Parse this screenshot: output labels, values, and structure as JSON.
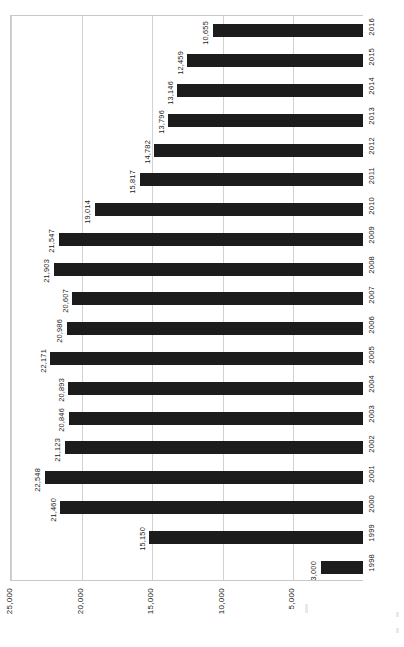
{
  "chart_data": {
    "type": "bar",
    "orientation": "horizontal",
    "page_rotation_deg": 90,
    "title": "",
    "subtitle": "",
    "xlabel": "",
    "ylabel": "",
    "categories": [
      "1998",
      "1999",
      "2000",
      "2001",
      "2002",
      "2003",
      "2004",
      "2005",
      "2006",
      "2007",
      "2008",
      "2009",
      "2010",
      "2011",
      "2012",
      "2013",
      "2014",
      "2015",
      "2016"
    ],
    "values": [
      3000,
      15150,
      21460,
      22548,
      21123,
      20846,
      20893,
      22171,
      20986,
      20607,
      21903,
      21547,
      19014,
      15817,
      14782,
      13796,
      13146,
      12459,
      10655
    ],
    "value_labels": [
      "3,000",
      "15,150",
      "21,460",
      "22,548",
      "21,123",
      "20,846",
      "20,893",
      "22,171",
      "20,986",
      "20,607",
      "21,903",
      "21,547",
      "19,014",
      "15,817",
      "14,782",
      "13,796",
      "13,146",
      "12,459",
      "10,655"
    ],
    "axis_ticks": [
      0,
      5000,
      10000,
      15000,
      20000,
      25000
    ],
    "axis_tick_labels": [
      "",
      "5,000",
      "10,000",
      "15,000",
      "20,000",
      "25,000"
    ],
    "xlim": [
      0,
      25000
    ],
    "grid": true,
    "legend": "none",
    "bar_color": "#1c1c1c",
    "grid_color": "#d2d2d2",
    "axis_color": "#c9c9c9"
  }
}
